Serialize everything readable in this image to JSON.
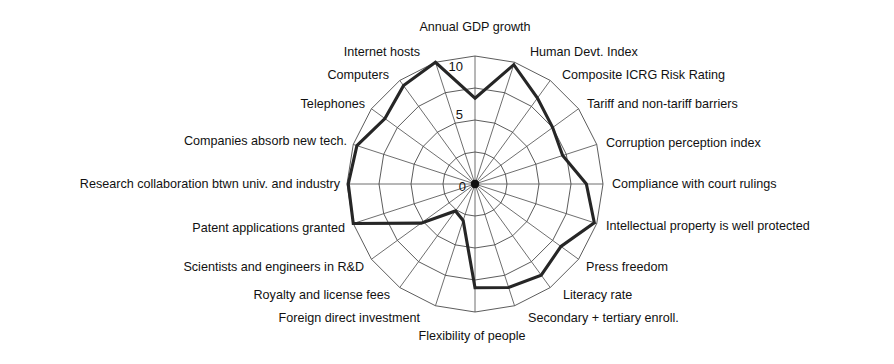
{
  "chart_data": {
    "type": "radar",
    "title": "",
    "subtitle": "",
    "xlabel": "",
    "ylabel": "",
    "rlim": [
      0,
      10
    ],
    "grid": true,
    "legend": "none",
    "tick_labels": [
      "0",
      "5",
      "10"
    ],
    "tick_values": [
      0,
      5,
      10
    ],
    "start_angle_deg": 90,
    "direction": "clockwise",
    "categories": [
      "Annual GDP growth",
      "Human Devt. Index",
      "Composite ICRG Risk Rating",
      "Tariff and non-tariff barriers",
      "Corruption perception index",
      "Compliance with court rulings",
      "Intellectual property is well protected",
      "Press freedom",
      "Literacy rate",
      "Secondary + tertiary enroll.",
      "Flexibility of people",
      "Foreign direct investment",
      "Royalty and license fees",
      "Scientists and engineers in R&D",
      "Patent applications granted",
      "Research collaboration btwn univ. and industry",
      "Companies absorb new tech.",
      "Telephones",
      "Computers",
      "Internet hosts"
    ],
    "values": [
      6.7,
      9.8,
      8.3,
      7.5,
      7.2,
      8.7,
      9.8,
      8.3,
      8.8,
      8.5,
      8.1,
      3.0,
      2.6,
      5.2,
      10.0,
      9.9,
      9.7,
      8.7,
      9.5,
      10.0
    ],
    "series": [
      {
        "name": "country profile",
        "values": [
          6.7,
          9.8,
          8.3,
          7.5,
          7.2,
          8.7,
          9.8,
          8.3,
          8.8,
          8.5,
          8.1,
          3.0,
          2.6,
          5.2,
          10.0,
          9.9,
          9.7,
          8.7,
          9.5,
          10.0
        ]
      }
    ],
    "colors": {
      "series_line": "#262626",
      "grid": "#4a4a4a",
      "background": "#ffffff",
      "text": "#111111"
    },
    "label_anchors": [
      {
        "text": "Annual GDP growth",
        "x": 475,
        "y": 31,
        "anchor": "middle"
      },
      {
        "text": "Human Devt. Index",
        "x": 530,
        "y": 56,
        "anchor": "start"
      },
      {
        "text": "Composite ICRG Risk Rating",
        "x": 562,
        "y": 79,
        "anchor": "start"
      },
      {
        "text": "Tariff and non-tariff barriers",
        "x": 587,
        "y": 108,
        "anchor": "start"
      },
      {
        "text": "Corruption perception index",
        "x": 606,
        "y": 147,
        "anchor": "start"
      },
      {
        "text": "Compliance with court rulings",
        "x": 612,
        "y": 188,
        "anchor": "start"
      },
      {
        "text": "Intellectual property is well protected",
        "x": 606,
        "y": 230,
        "anchor": "start"
      },
      {
        "text": "Press freedom",
        "x": 586,
        "y": 271,
        "anchor": "start"
      },
      {
        "text": "Literacy rate",
        "x": 563,
        "y": 299,
        "anchor": "start"
      },
      {
        "text": "Secondary + tertiary enroll.",
        "x": 528,
        "y": 322,
        "anchor": "start"
      },
      {
        "text": "Flexibility of people",
        "x": 472,
        "y": 340,
        "anchor": "middle"
      },
      {
        "text": "Foreign direct investment",
        "x": 420,
        "y": 322,
        "anchor": "end"
      },
      {
        "text": "Royalty and license fees",
        "x": 390,
        "y": 299,
        "anchor": "end"
      },
      {
        "text": "Scientists and engineers in R&D",
        "x": 364,
        "y": 271,
        "anchor": "end"
      },
      {
        "text": "Patent applications granted",
        "x": 345,
        "y": 232,
        "anchor": "end"
      },
      {
        "text": "Research collaboration btwn univ. and industry",
        "x": 340,
        "y": 188,
        "anchor": "end"
      },
      {
        "text": "Companies absorb new tech.",
        "x": 347,
        "y": 145,
        "anchor": "end"
      },
      {
        "text": "Telephones",
        "x": 365,
        "y": 108,
        "anchor": "end"
      },
      {
        "text": "Computers",
        "x": 389,
        "y": 79,
        "anchor": "end"
      },
      {
        "text": "Internet hosts",
        "x": 420,
        "y": 56,
        "anchor": "end"
      }
    ],
    "tick_label_positions": [
      {
        "text": "10",
        "x": 463,
        "y": 71
      },
      {
        "text": "5",
        "x": 463,
        "y": 119
      },
      {
        "text": "0",
        "x": 466,
        "y": 191
      }
    ]
  },
  "figure": {
    "center_x": 475,
    "center_y": 184,
    "radius_max": 128
  }
}
